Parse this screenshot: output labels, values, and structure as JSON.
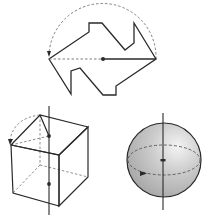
{
  "diagram": {
    "colors": {
      "stroke": "#2a2a2a",
      "dashed": "#6a6a6a",
      "sphere_fill": "#c4c4c4",
      "sphere_highlight": "#f2f2f2"
    },
    "figures": [
      {
        "name": "rotated-polygon",
        "type": "plane-rotation",
        "center": [
          103,
          59
        ]
      },
      {
        "name": "cube",
        "type": "axis-rotation",
        "axis_x": 49
      },
      {
        "name": "sphere",
        "type": "axis-rotation",
        "center": [
          164,
          160
        ],
        "radius": 37
      }
    ]
  }
}
